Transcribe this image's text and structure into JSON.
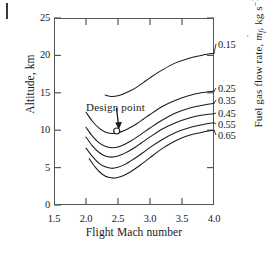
{
  "figure": {
    "background_color": "#ffffff",
    "line_color": "#1a1a1a",
    "frame_color": "#555555"
  },
  "chart_data": {
    "type": "line",
    "title": "",
    "subtitle": "",
    "xlabel": "Flight Mach number",
    "ylabel": "Altitude, km",
    "y2label": "Fuel gas flow rate, ṁf, kg s⁻¹",
    "xlim": [
      1.5,
      4.0
    ],
    "ylim": [
      0,
      25
    ],
    "xticks": [
      "1.5",
      "2.0",
      "2.5",
      "3.0",
      "3.5",
      "4.0"
    ],
    "yticks": [
      "0",
      "5",
      "10",
      "15",
      "20",
      "25"
    ],
    "grid": false,
    "legend_position": "right-axis-curve-labels",
    "series": [
      {
        "name": "0.15",
        "label": "0.15",
        "label_y_px": 39,
        "points": [
          [
            2.3,
            14.7
          ],
          [
            2.4,
            14.5
          ],
          [
            2.5,
            14.6
          ],
          [
            2.6,
            14.9
          ],
          [
            2.7,
            15.3
          ],
          [
            2.8,
            15.8
          ],
          [
            2.9,
            16.4
          ],
          [
            3.0,
            17.0
          ],
          [
            3.2,
            18.1
          ],
          [
            3.4,
            19.0
          ],
          [
            3.6,
            19.6
          ],
          [
            3.8,
            20.0
          ],
          [
            4.0,
            20.3
          ]
        ]
      },
      {
        "name": "0.25",
        "label": "0.25",
        "label_y_px": 83,
        "points": [
          [
            2.0,
            12.4
          ],
          [
            2.1,
            11.2
          ],
          [
            2.2,
            10.3
          ],
          [
            2.3,
            9.75
          ],
          [
            2.4,
            9.55
          ],
          [
            2.5,
            9.65
          ],
          [
            2.6,
            9.95
          ],
          [
            2.7,
            10.4
          ],
          [
            2.8,
            10.9
          ],
          [
            2.9,
            11.5
          ],
          [
            3.0,
            12.1
          ],
          [
            3.2,
            13.2
          ],
          [
            3.4,
            14.0
          ],
          [
            3.6,
            14.6
          ],
          [
            3.8,
            15.0
          ],
          [
            4.0,
            15.2
          ]
        ]
      },
      {
        "name": "0.35",
        "label": "0.35",
        "label_y_px": 95,
        "points": [
          [
            2.0,
            10.4
          ],
          [
            2.1,
            9.2
          ],
          [
            2.2,
            8.35
          ],
          [
            2.3,
            7.85
          ],
          [
            2.4,
            7.65
          ],
          [
            2.5,
            7.75
          ],
          [
            2.6,
            8.1
          ],
          [
            2.7,
            8.55
          ],
          [
            2.8,
            9.1
          ],
          [
            2.9,
            9.7
          ],
          [
            3.0,
            10.3
          ],
          [
            3.2,
            11.4
          ],
          [
            3.4,
            12.3
          ],
          [
            3.6,
            12.9
          ],
          [
            3.8,
            13.3
          ],
          [
            4.0,
            13.6
          ]
        ]
      },
      {
        "name": "0.45",
        "label": "0.45",
        "label_y_px": 108,
        "points": [
          [
            2.0,
            9.1
          ],
          [
            2.1,
            7.9
          ],
          [
            2.2,
            7.05
          ],
          [
            2.3,
            6.55
          ],
          [
            2.4,
            6.4
          ],
          [
            2.5,
            6.55
          ],
          [
            2.6,
            6.9
          ],
          [
            2.7,
            7.35
          ],
          [
            2.8,
            7.9
          ],
          [
            2.9,
            8.5
          ],
          [
            3.0,
            9.1
          ],
          [
            3.2,
            10.2
          ],
          [
            3.4,
            11.0
          ],
          [
            3.6,
            11.6
          ],
          [
            3.8,
            12.0
          ],
          [
            4.0,
            12.2
          ]
        ]
      },
      {
        "name": "0.55",
        "label": "0.55",
        "label_y_px": 119,
        "points": [
          [
            2.0,
            7.6
          ],
          [
            2.1,
            6.5
          ],
          [
            2.2,
            5.6
          ],
          [
            2.3,
            5.1
          ],
          [
            2.4,
            4.9
          ],
          [
            2.5,
            5.05
          ],
          [
            2.6,
            5.4
          ],
          [
            2.7,
            5.9
          ],
          [
            2.8,
            6.45
          ],
          [
            2.9,
            7.05
          ],
          [
            3.0,
            7.7
          ],
          [
            3.2,
            8.8
          ],
          [
            3.4,
            9.7
          ],
          [
            3.6,
            10.3
          ],
          [
            3.8,
            10.7
          ],
          [
            4.0,
            11.0
          ]
        ]
      },
      {
        "name": "0.65",
        "label": "0.65",
        "label_y_px": 130,
        "points": [
          [
            2.05,
            6.2
          ],
          [
            2.15,
            5.0
          ],
          [
            2.25,
            4.15
          ],
          [
            2.35,
            3.7
          ],
          [
            2.45,
            3.6
          ],
          [
            2.55,
            3.8
          ],
          [
            2.65,
            4.2
          ],
          [
            2.75,
            4.75
          ],
          [
            2.85,
            5.35
          ],
          [
            2.95,
            6.0
          ],
          [
            3.05,
            6.65
          ],
          [
            3.2,
            7.6
          ],
          [
            3.4,
            8.6
          ],
          [
            3.6,
            9.3
          ],
          [
            3.8,
            9.7
          ],
          [
            4.0,
            10.0
          ]
        ]
      }
    ],
    "annotations": [
      {
        "text": "Design point",
        "marker": "open-circle",
        "marker_x": 2.48,
        "marker_y": 9.9,
        "arrow": "down"
      }
    ]
  }
}
